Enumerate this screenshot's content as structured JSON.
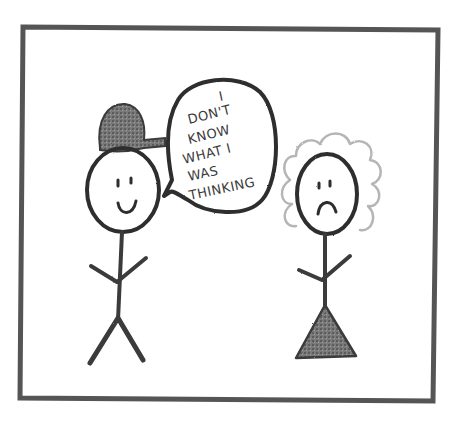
{
  "comic": {
    "frame_color": "#555555",
    "background": "#ffffff",
    "speech_bubble": {
      "lines": [
        "I",
        "DON'T",
        "KNOW",
        "WHAT I",
        "WAS",
        "THINKING"
      ]
    },
    "characters": [
      {
        "role": "speaker",
        "expression": "smile",
        "hat": "baseball-cap",
        "body": "stick"
      },
      {
        "role": "listener",
        "expression": "frown",
        "hair": "curly",
        "body": "stick-with-triangle-dress"
      }
    ]
  }
}
